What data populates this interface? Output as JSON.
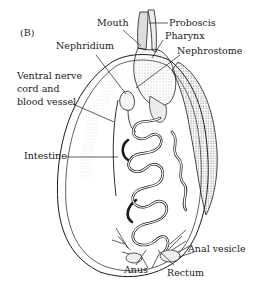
{
  "figure": {
    "panel": "(B)",
    "labels": {
      "mouth": "Mouth",
      "proboscis": "Proboscis",
      "pharynx": "Pharynx",
      "nephridium": "Nephridium",
      "nephrostome": "Nephrostome",
      "ventral_line1": "Ventral nerve",
      "ventral_line2": "cord and",
      "ventral_line3": "blood vessel",
      "intestine": "Intestine",
      "anal_vesicle": "Anal vesicle",
      "anus": "Anus",
      "rectum": "Rectum"
    },
    "colors": {
      "ink": "#1a1a1a",
      "shade": "#c8c8c8",
      "background": "#ffffff"
    }
  }
}
